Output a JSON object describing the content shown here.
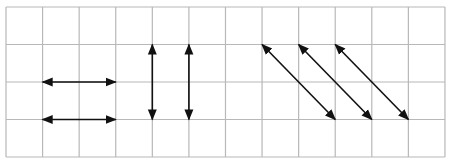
{
  "diagram": {
    "colors": {
      "background": "#ffffff",
      "grid": "#b8b8b8",
      "arrow": "#111111"
    },
    "grid": {
      "x0": 6,
      "y0": 7,
      "cols": 12,
      "rows": 4,
      "cell_w": 36.58,
      "cell_h": 37.5
    },
    "arrows": [
      {
        "id": "horizontal-arrow-1",
        "from": [
          1,
          2
        ],
        "to": [
          3,
          2
        ],
        "style": "double"
      },
      {
        "id": "horizontal-arrow-2",
        "from": [
          1,
          3
        ],
        "to": [
          3,
          3
        ],
        "style": "double"
      },
      {
        "id": "vertical-arrow-1",
        "from": [
          4,
          1
        ],
        "to": [
          4,
          3
        ],
        "style": "double"
      },
      {
        "id": "vertical-arrow-2",
        "from": [
          5,
          1
        ],
        "to": [
          5,
          3
        ],
        "style": "double"
      },
      {
        "id": "diagonal-arrow-1",
        "from": [
          7,
          1
        ],
        "to": [
          9,
          3
        ],
        "style": "double"
      },
      {
        "id": "diagonal-arrow-2",
        "from": [
          8,
          1
        ],
        "to": [
          10,
          3
        ],
        "style": "double"
      },
      {
        "id": "diagonal-arrow-3",
        "from": [
          9,
          1
        ],
        "to": [
          11,
          3
        ],
        "style": "double"
      }
    ]
  }
}
